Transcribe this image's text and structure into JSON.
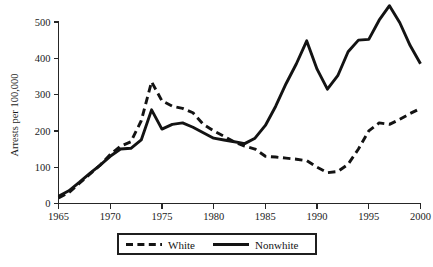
{
  "figure": {
    "background_color": "#ffffff",
    "line_color": "#131313"
  },
  "axes": {
    "y_title": "Arrests per 100,000",
    "y_ticks": [
      "0",
      "100",
      "200",
      "300",
      "400",
      "500"
    ],
    "x_ticks": [
      "1965",
      "1970",
      "1975",
      "1980",
      "1985",
      "1990",
      "1995",
      "2000"
    ]
  },
  "legend": {
    "items": [
      {
        "label": "White",
        "style": "dashed"
      },
      {
        "label": "Nonwhite",
        "style": "solid"
      }
    ]
  },
  "caption": {
    "partial_text": ""
  },
  "chart_data": {
    "type": "line",
    "title": "",
    "subtitle": "",
    "xlabel": "",
    "ylabel": "Arrests per 100,000",
    "xlim": [
      1965,
      2000
    ],
    "ylim": [
      0,
      545
    ],
    "grid": false,
    "legend_position": "bottom-center",
    "xticks": [
      1965,
      1970,
      1975,
      1980,
      1985,
      1990,
      1995,
      2000
    ],
    "yticks": [
      0,
      100,
      200,
      300,
      400,
      500
    ],
    "x": [
      1965,
      1966,
      1967,
      1968,
      1969,
      1970,
      1971,
      1972,
      1973,
      1974,
      1975,
      1976,
      1977,
      1978,
      1979,
      1980,
      1981,
      1982,
      1983,
      1984,
      1985,
      1986,
      1987,
      1988,
      1989,
      1990,
      1991,
      1992,
      1993,
      1994,
      1995,
      1996,
      1997,
      1998,
      1999,
      2000
    ],
    "series": [
      {
        "name": "White",
        "style": "dashed",
        "color": "#131313",
        "values": [
          15,
          30,
          55,
          80,
          105,
          135,
          158,
          170,
          228,
          335,
          283,
          268,
          262,
          250,
          218,
          200,
          185,
          170,
          158,
          150,
          130,
          128,
          125,
          122,
          118,
          100,
          85,
          88,
          108,
          150,
          200,
          222,
          218,
          232,
          248,
          262
        ]
      },
      {
        "name": "Nonwhite",
        "style": "solid",
        "color": "#131313",
        "values": [
          20,
          35,
          58,
          82,
          105,
          130,
          150,
          152,
          175,
          258,
          205,
          218,
          222,
          210,
          195,
          180,
          175,
          170,
          165,
          180,
          215,
          268,
          330,
          385,
          448,
          370,
          315,
          352,
          418,
          450,
          452,
          505,
          545,
          498,
          435,
          385
        ]
      }
    ]
  }
}
